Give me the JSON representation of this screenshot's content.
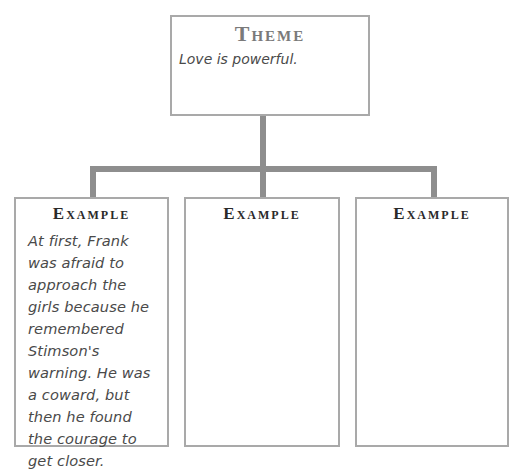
{
  "theme": {
    "heading": "Theme",
    "text": "Love is powerful."
  },
  "examples": [
    {
      "heading": "Example",
      "text": "At first, Frank was afraid to approach the girls because he remembered Stimson's warning. He was a coward, but then he found the courage to get closer."
    },
    {
      "heading": "Example",
      "text": ""
    },
    {
      "heading": "Example",
      "text": ""
    }
  ],
  "colors": {
    "box_border": "#a9a9a9",
    "connector": "#8e8e8e",
    "theme_heading": "#7a7a7a",
    "example_heading": "#2a2a2a",
    "body_text": "#4a4a4a"
  }
}
